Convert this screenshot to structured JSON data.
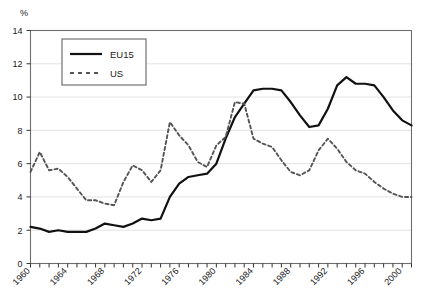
{
  "chart_data": {
    "type": "line",
    "title": "",
    "subtitle": "",
    "xlabel": "",
    "ylabel": "%",
    "unit_label": "%",
    "xlim": [
      1960,
      2001
    ],
    "ylim": [
      0,
      14
    ],
    "ytick_step": 2,
    "yticks": [
      0,
      2,
      4,
      6,
      8,
      10,
      12,
      14
    ],
    "ytick_labels": [
      "0",
      "2",
      "4",
      "6",
      "8",
      "10",
      "12",
      "14"
    ],
    "xticks_labeled": [
      1960,
      1964,
      1968,
      1972,
      1976,
      1980,
      1984,
      1988,
      1992,
      1996,
      2000
    ],
    "xtick_labels": [
      "1960",
      "1964",
      "1968",
      "1972",
      "1976",
      "1980",
      "1984",
      "1988",
      "1992",
      "1996",
      "2000"
    ],
    "xtick_minor_step": 1,
    "xtick_label_rotation": -45,
    "grid": "horizontal",
    "frame": true,
    "legend_position": "top-left-inside",
    "x": [
      1960,
      1961,
      1962,
      1963,
      1964,
      1965,
      1966,
      1967,
      1968,
      1969,
      1970,
      1971,
      1972,
      1973,
      1974,
      1975,
      1976,
      1977,
      1978,
      1979,
      1980,
      1981,
      1982,
      1983,
      1984,
      1985,
      1986,
      1987,
      1988,
      1989,
      1990,
      1991,
      1992,
      1993,
      1994,
      1995,
      1996,
      1997,
      1998,
      1999,
      2000,
      2001
    ],
    "series": [
      {
        "name": "EU15",
        "style": "solid",
        "color": "#111111",
        "values": [
          2.2,
          2.1,
          1.9,
          2.0,
          1.9,
          1.9,
          1.9,
          2.1,
          2.4,
          2.3,
          2.2,
          2.4,
          2.7,
          2.6,
          2.7,
          4.0,
          4.8,
          5.2,
          5.3,
          5.4,
          6.0,
          7.5,
          8.8,
          9.6,
          10.4,
          10.5,
          10.5,
          10.4,
          9.7,
          8.9,
          8.2,
          8.3,
          9.3,
          10.7,
          11.2,
          10.8,
          10.8,
          10.7,
          10.0,
          9.2,
          8.6,
          8.3
        ]
      },
      {
        "name": "US",
        "style": "dashed",
        "color": "#555555",
        "values": [
          5.5,
          6.7,
          5.6,
          5.7,
          5.2,
          4.5,
          3.8,
          3.8,
          3.6,
          3.5,
          4.9,
          5.9,
          5.6,
          4.9,
          5.6,
          8.5,
          7.7,
          7.1,
          6.1,
          5.8,
          7.1,
          7.6,
          9.7,
          9.6,
          7.5,
          7.2,
          7.0,
          6.2,
          5.5,
          5.3,
          5.6,
          6.8,
          7.5,
          6.9,
          6.1,
          5.6,
          5.4,
          4.9,
          4.5,
          4.2,
          4.0,
          4.0
        ]
      }
    ]
  },
  "legend": {
    "items": [
      {
        "label": "EU15",
        "style": "solid"
      },
      {
        "label": "US",
        "style": "dashed"
      }
    ]
  }
}
